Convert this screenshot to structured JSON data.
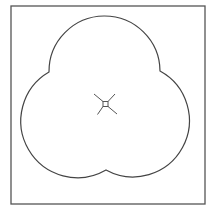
{
  "diagram": {
    "type": "trefoil",
    "stroke_color": "#444444",
    "frame_color": "#555555",
    "background": "#ffffff",
    "frame": {
      "x": 11,
      "y": 6,
      "width": 194,
      "height": 198
    },
    "lobes": [
      {
        "name": "top",
        "cx": 106,
        "cy": 60,
        "r": 51
      },
      {
        "name": "left",
        "cx": 66,
        "cy": 129,
        "r": 51
      },
      {
        "name": "right",
        "cx": 147,
        "cy": 129,
        "r": 51
      }
    ],
    "center_marker": {
      "cx": 105.5,
      "cy": 104,
      "box_size": 5
    }
  }
}
